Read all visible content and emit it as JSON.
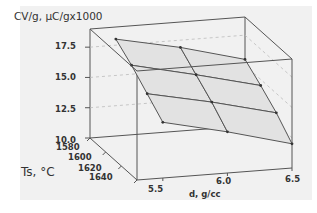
{
  "chart_data": {
    "type": "surface3d",
    "title": "",
    "zlabel": "CV/g, μC/gx1000",
    "xlabel": "d, g/cc",
    "ylabel": "Ts, °C",
    "x_ticks": [
      "5.5",
      "6.0",
      "6.5"
    ],
    "y_ticks": [
      "1580",
      "1600",
      "1620",
      "1640"
    ],
    "z_ticks": [
      "17.5",
      "15.0",
      "12.5",
      "10.0"
    ],
    "xlim": [
      5.3,
      6.5
    ],
    "ylim": [
      1580,
      1640
    ],
    "zlim": [
      10.0,
      19.0
    ],
    "x": [
      5.5,
      6.0,
      6.5
    ],
    "y": [
      1580,
      1600,
      1620,
      1640
    ],
    "z_grid": [
      [
        18.0,
        16.9,
        15.5
      ],
      [
        17.0,
        15.8,
        14.5
      ],
      [
        15.8,
        14.7,
        13.4
      ],
      [
        14.6,
        13.4,
        12.0
      ]
    ],
    "surface_color": "#e2e2e2",
    "grid_color": "#555555"
  }
}
